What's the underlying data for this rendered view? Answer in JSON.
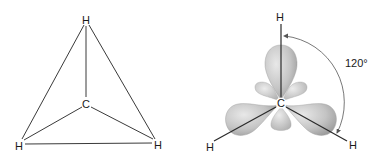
{
  "left_diagram": {
    "title": "Tetrahedral projection",
    "atoms": [
      {
        "id": "h_top",
        "label": "H",
        "x": 86,
        "y": 20
      },
      {
        "id": "c_center",
        "label": "C",
        "x": 86,
        "y": 104
      },
      {
        "id": "h_bottom_left",
        "label": "H",
        "x": 19,
        "y": 146
      },
      {
        "id": "h_bottom_right",
        "label": "H",
        "x": 158,
        "y": 145
      }
    ]
  },
  "right_diagram": {
    "title": "Trigonal planar orbitals",
    "atoms": [
      {
        "id": "h_top",
        "label": "H",
        "x": 280,
        "y": 17
      },
      {
        "id": "c_center",
        "label": "C",
        "x": 281,
        "y": 104
      },
      {
        "id": "h_bottom_left",
        "label": "H",
        "x": 210,
        "y": 147
      },
      {
        "id": "h_bottom_right",
        "label": "H",
        "x": 353,
        "y": 145
      }
    ],
    "angle_label": "120°"
  },
  "colors": {
    "lobe_fill_light": "#e4e4e4",
    "lobe_fill_dark": "#a8a8a8",
    "line": "#333333"
  }
}
